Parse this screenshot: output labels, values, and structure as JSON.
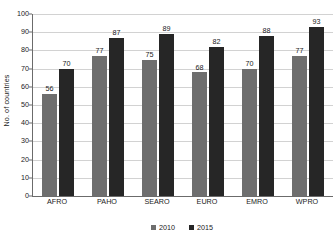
{
  "chart_data": {
    "type": "bar",
    "title": "",
    "subtitle": "",
    "xlabel": "",
    "ylabel": "No. of countries",
    "categories": [
      "AFRO",
      "PAHO",
      "SEARO",
      "EURO",
      "EMRO",
      "WPRO"
    ],
    "series": [
      {
        "name": "2010",
        "color": "#6e6e6e",
        "values": [
          56,
          77,
          75,
          68,
          70,
          77
        ]
      },
      {
        "name": "2015",
        "color": "#262626",
        "values": [
          70,
          87,
          89,
          82,
          88,
          93
        ]
      }
    ],
    "ylim": [
      0,
      100
    ],
    "ytick_step": 10,
    "yticks": [
      "100",
      "90",
      "80",
      "70",
      "60",
      "50",
      "40",
      "30",
      "20",
      "10",
      "0"
    ],
    "grid": "horizontal",
    "legend_position": "bottom-center",
    "data_labels": true
  },
  "axes": {
    "y_title": "No. of countries"
  },
  "legend": {
    "items": [
      {
        "label": "2010",
        "color": "#6e6e6e"
      },
      {
        "label": "2015",
        "color": "#262626"
      }
    ]
  }
}
